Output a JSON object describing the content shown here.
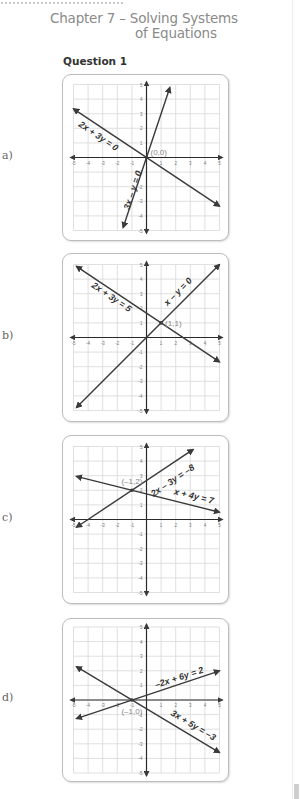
{
  "header": {
    "chapter_line1": "Chapter 7 – Solving Systems",
    "chapter_line2": "of Equations",
    "question": "Question 1"
  },
  "parts": [
    {
      "label": "a)",
      "top": 74,
      "height": 165,
      "lines": [
        {
          "equation": "2x + 3y = 0",
          "from": [
            -5,
            3.33
          ],
          "to": [
            5,
            -3.33
          ]
        },
        {
          "equation": "3x – y = 0",
          "from": [
            -1.6,
            -4.8
          ],
          "to": [
            1.6,
            4.8
          ]
        }
      ],
      "labels": [
        {
          "text": "2x + 3y = 0",
          "x": -3.4,
          "y": 1.3,
          "angle": 34
        },
        {
          "text": "3x – y = 0",
          "x": -0.75,
          "y": -2.3,
          "angle": -72
        }
      ],
      "intersection": {
        "text": "(0,0)",
        "x": 0,
        "y": 0
      }
    },
    {
      "label": "b)",
      "top": 253,
      "height": 167,
      "lines": [
        {
          "equation": "2x + 3y = 5",
          "from": [
            -4.8,
            4.87
          ],
          "to": [
            5,
            -1.67
          ]
        },
        {
          "equation": "x – y = 0",
          "from": [
            -4.8,
            -4.8
          ],
          "to": [
            5,
            5
          ]
        }
      ],
      "labels": [
        {
          "text": "2x + 3y = 5",
          "x": -2.5,
          "y": 2.6,
          "angle": 34
        },
        {
          "text": "x – y = 0",
          "x": 2.3,
          "y": 3.0,
          "angle": -45
        }
      ],
      "intersection": {
        "text": "(1,1)",
        "x": 1,
        "y": 1
      }
    },
    {
      "label": "c)",
      "top": 435,
      "height": 167,
      "lines": [
        {
          "equation": "2x – 3y = –8",
          "from": [
            -4.8,
            -0.53
          ],
          "to": [
            3.2,
            4.8
          ]
        },
        {
          "equation": "x + 4y = 7",
          "from": [
            -4.8,
            2.95
          ],
          "to": [
            5,
            0.5
          ]
        }
      ],
      "labels": [
        {
          "text": "2x – 3y = –8",
          "x": 1.9,
          "y": 2.5,
          "angle": -34
        },
        {
          "text": "x + 4y = 7",
          "x": 3.2,
          "y": 1.4,
          "angle": 14
        }
      ],
      "intersection": {
        "text": "(–1,2)",
        "x": -1,
        "y": 2
      }
    },
    {
      "label": "d)",
      "top": 618,
      "height": 162,
      "lines": [
        {
          "equation": "–2x + 6y = 2",
          "from": [
            -4.8,
            -1.27
          ],
          "to": [
            5,
            2
          ]
        },
        {
          "equation": "3x + 5y = –3",
          "from": [
            -4.8,
            2.28
          ],
          "to": [
            5,
            -3.6
          ]
        }
      ],
      "labels": [
        {
          "text": "–2x + 6y = 2",
          "x": 2.3,
          "y": 1.35,
          "angle": -18
        },
        {
          "text": "3x + 5y = –3",
          "x": 3.1,
          "y": -1.9,
          "angle": 31
        }
      ],
      "intersection": {
        "text": "(–1,0)",
        "x": -1,
        "y": 0
      }
    }
  ],
  "axis": {
    "min": -5,
    "max": 5,
    "x_ticks": [
      "-5",
      "-4",
      "-3",
      "-2",
      "-1",
      "1",
      "2",
      "3",
      "4",
      "5"
    ],
    "y_ticks": [
      "5",
      "4",
      "3",
      "2",
      "1",
      "-1",
      "-2",
      "-3",
      "-4",
      "-5"
    ]
  },
  "colors": {
    "line": "#3a3a3a",
    "grid": "#d8d8d8",
    "axis": "#2a2a2a",
    "tick_text": "#777777",
    "intersection_text": "#888888",
    "title_text": "#8a8a8a"
  }
}
